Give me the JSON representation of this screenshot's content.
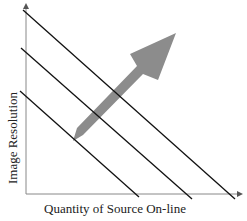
{
  "diagram": {
    "type": "conceptual-tradeoff",
    "axes": {
      "x_label": "Quantity of Source On-line",
      "y_label": "Image Resolution"
    },
    "lines": [
      {
        "id": "line-1",
        "x1": 23,
        "y1": 10,
        "x2": 235,
        "y2": 199
      },
      {
        "id": "line-2",
        "x1": 21,
        "y1": 48,
        "x2": 192,
        "y2": 199
      },
      {
        "id": "line-3",
        "x1": 20,
        "y1": 91,
        "x2": 139,
        "y2": 197
      }
    ],
    "arrow": {
      "color": "#8c8c8c",
      "direction": "up-right"
    },
    "colors": {
      "line": "#111111",
      "axis": "#888888",
      "arrow": "#8c8c8c",
      "text": "#222222"
    }
  }
}
